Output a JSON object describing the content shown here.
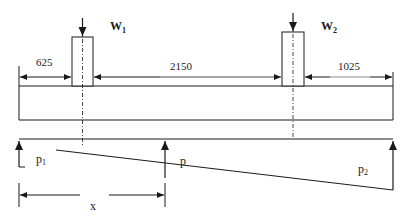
{
  "diagram": {
    "type": "combined footing load and soil pressure diagram",
    "loads": [
      {
        "name": "W",
        "subscript": "1"
      },
      {
        "name": "W",
        "subscript": "2"
      }
    ],
    "dimensions": {
      "left_overhang": "625",
      "column_spacing": "2150",
      "right_overhang": "1025",
      "distance": "x"
    },
    "pressures": {
      "p1": {
        "base": "p",
        "subscript": "1"
      },
      "p": {
        "base": "p"
      },
      "p2": {
        "base": "p",
        "subscript": "2"
      }
    },
    "colors": {
      "stroke": "#1a1a1a",
      "background": "#ffffff"
    }
  }
}
